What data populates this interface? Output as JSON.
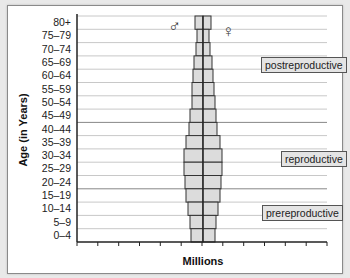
{
  "chart_data": {
    "type": "bar",
    "subtype": "population-pyramid",
    "title": "",
    "ylabel": "Age (in Years)",
    "xlabel": "Millions",
    "categories": [
      "80+",
      "75–79",
      "70–74",
      "65–69",
      "60–64",
      "55–59",
      "50–54",
      "45–49",
      "40–44",
      "35–39",
      "30–34",
      "25–29",
      "20–24",
      "15–19",
      "10–14",
      "5–9",
      "0–4"
    ],
    "series": [
      {
        "name": "male",
        "symbol": "♂",
        "values": [
          0.4,
          0.3,
          0.35,
          0.45,
          0.5,
          0.55,
          0.55,
          0.65,
          0.7,
          0.85,
          0.95,
          0.95,
          0.9,
          0.85,
          0.75,
          0.65,
          0.6
        ]
      },
      {
        "name": "female",
        "symbol": "♀",
        "values": [
          0.4,
          0.3,
          0.35,
          0.45,
          0.5,
          0.55,
          0.6,
          0.65,
          0.7,
          0.85,
          0.95,
          0.95,
          0.9,
          0.85,
          0.75,
          0.65,
          0.6
        ]
      }
    ],
    "x_ticks_count": 13,
    "grid": "horizontal",
    "regions": [
      {
        "label": "postreproductive",
        "from": "45–49",
        "to": "80+"
      },
      {
        "label": "reproductive",
        "from": "20–24",
        "to": "40–44"
      },
      {
        "label": "prereproductive",
        "from": "0–4",
        "to": "15–19"
      }
    ],
    "colors": {
      "bar_fill": "#dcdcdc",
      "bar_stroke": "#333333",
      "grid": "#c8c8c8",
      "major_grid": "#888888"
    }
  },
  "labels": {
    "male_symbol": "♂",
    "female_symbol": "♀",
    "postreproductive": "postreproductive",
    "reproductive": "reproductive",
    "prereproductive": "prereproductive"
  }
}
